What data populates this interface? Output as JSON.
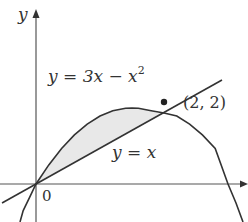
{
  "figure": {
    "axes": {
      "x_label": "x",
      "y_label": "y",
      "origin_label": "0"
    },
    "curves": [
      {
        "name": "parabola",
        "equation": "y = 3x − x²",
        "label_prefix": "y = 3x − x",
        "label_sup": "2"
      },
      {
        "name": "line",
        "equation": "y = x",
        "label": "y = x"
      }
    ],
    "intersection_point": {
      "label": "(2, 2)",
      "x": 2,
      "y": 2
    },
    "shaded_region": "area between y = 3x − x² and y = x for 0 ≤ x ≤ 2",
    "colors": {
      "curve": "#333333",
      "axis": "#555555",
      "shade": "#e6e6e6"
    }
  }
}
